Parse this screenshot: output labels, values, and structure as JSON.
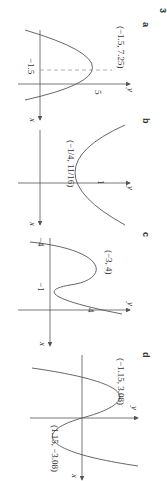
{
  "figure": {
    "number": "3",
    "orientation": "rotated 90 degrees clockwise",
    "panels": [
      {
        "label": "a",
        "axes": {
          "x": "x",
          "y": "y"
        },
        "curve": "downward parabola",
        "point_label": "(−1.5, 7.25)",
        "tick_labels": [
          "−1.5",
          "5"
        ],
        "dashed_guides": true
      },
      {
        "label": "b",
        "axes": {
          "x": "x",
          "y": "y"
        },
        "curve": "upward parabola",
        "point_label": "(−1/4, 11/16)",
        "point_label_x_num": "1",
        "point_label_x_den": "4",
        "point_label_y_num": "11",
        "point_label_y_den": "16",
        "tick_labels": [
          "1"
        ]
      },
      {
        "label": "c",
        "axes": {
          "x": "x",
          "y": "y"
        },
        "curve": "cubic",
        "point_label": "(−3, 4)",
        "tick_labels": [
          "−4",
          "−1",
          "4"
        ]
      },
      {
        "label": "d",
        "axes": {
          "x": "x",
          "y": "y"
        },
        "curve": "cubic through origin",
        "point_labels": [
          "(−1.15, 3.08)",
          "(1.15, −3.08)"
        ]
      }
    ]
  }
}
